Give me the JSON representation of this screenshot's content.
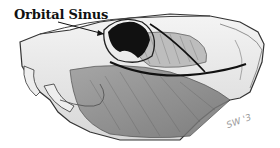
{
  "diagram": {
    "label": "Orbital Sinus",
    "signature": "SW '3"
  }
}
